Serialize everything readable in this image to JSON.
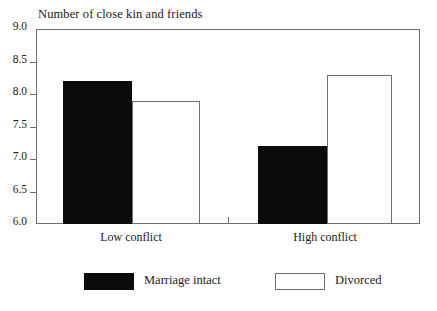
{
  "chart_data": {
    "type": "bar",
    "title": "Number of close kin and friends",
    "xlabel": "",
    "ylabel": "",
    "ylim": [
      6.0,
      9.0
    ],
    "yticks": [
      "9.0",
      "8.5",
      "8.0",
      "7.5",
      "7.0",
      "6.5",
      "6.0"
    ],
    "ytick_values": [
      9.0,
      8.5,
      8.0,
      7.5,
      7.0,
      6.5,
      6.0
    ],
    "grid": false,
    "legend_position": "bottom",
    "categories": [
      "Low conflict",
      "High conflict"
    ],
    "series": [
      {
        "name": "Marriage intact",
        "values": [
          8.2,
          7.2
        ],
        "style": "filled",
        "color": "#0b0b0b"
      },
      {
        "name": "Divorced",
        "values": [
          7.9,
          8.3
        ],
        "style": "hollow",
        "color": "#ffffff"
      }
    ]
  },
  "axis": {
    "y_labels": [
      {
        "text": "9.0",
        "value": 9.0
      },
      {
        "text": "8.5",
        "value": 8.5
      },
      {
        "text": "8.0",
        "value": 8.0
      },
      {
        "text": "7.5",
        "value": 7.5
      },
      {
        "text": "7.0",
        "value": 7.0
      },
      {
        "text": "6.5",
        "value": 6.5
      },
      {
        "text": "6.0",
        "value": 6.0
      }
    ],
    "x_labels": [
      "Low conflict",
      "High conflict"
    ]
  },
  "legend": {
    "items": [
      {
        "label": "Marriage intact",
        "style": "filled"
      },
      {
        "label": "Divorced",
        "style": "hollow"
      }
    ]
  },
  "colors": {
    "bar_filled": "#0b0b0b",
    "bar_hollow": "#ffffff",
    "frame": "#6e6e6e",
    "text": "#1a1a1a",
    "background": "#ffffff"
  }
}
